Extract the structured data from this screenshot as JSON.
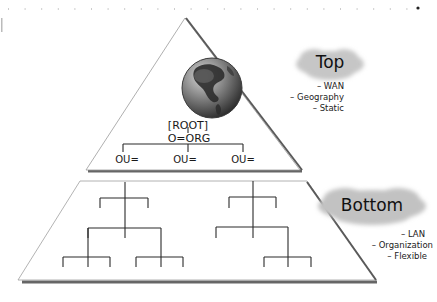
{
  "diagram": {
    "type": "directory-tree-pyramid",
    "colors": {
      "outline": "#7a7a7a",
      "shadow": "#6b6b6b",
      "tree_line": "#2a2a2a",
      "cloud": "#c8c8c8",
      "globe_ocean": "#6e6e6e",
      "globe_land": "#2e2e2e",
      "text": "#1a1a1a"
    },
    "top_tier": {
      "root_label": "[ROOT]",
      "org_label": "O=ORG",
      "ou_labels": [
        "OU=",
        "OU=",
        "OU="
      ],
      "cloud_label": "Top",
      "bullets": [
        "– WAN",
        "– Geography",
        "– Static"
      ]
    },
    "bottom_tier": {
      "cloud_label": "Bottom",
      "bullets": [
        "– LAN",
        "– Organization",
        "– Flexible"
      ]
    }
  }
}
